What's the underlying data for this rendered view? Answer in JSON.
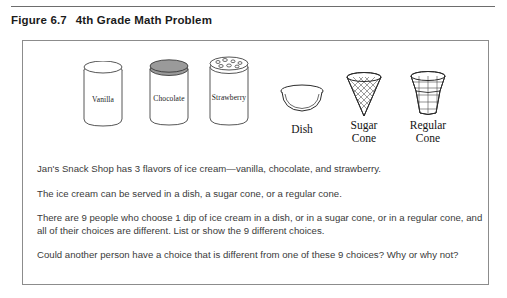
{
  "caption": {
    "figure_number": "Figure 6.7",
    "title": "4th Grade Math Problem"
  },
  "illustration": {
    "tubs": [
      {
        "label": "Vanilla",
        "lid": "plain",
        "icon": "ice-cream-tub-vanilla"
      },
      {
        "label": "Chocolate",
        "lid": "dark",
        "icon": "ice-cream-tub-chocolate"
      },
      {
        "label": "Strawberry",
        "lid": "speckled",
        "icon": "ice-cream-tub-strawberry"
      }
    ],
    "servings": [
      {
        "label": "Dish",
        "icon": "dish-icon"
      },
      {
        "label": "Sugar\nCone",
        "line1": "Sugar",
        "line2": "Cone",
        "icon": "sugar-cone-icon"
      },
      {
        "label": "Regular\nCone",
        "line1": "Regular",
        "line2": "Cone",
        "icon": "regular-cone-icon"
      }
    ]
  },
  "problem": {
    "paragraphs": [
      "Jan's Snack Shop has 3 flavors of ice cream—vanilla, chocolate, and strawberry.",
      "The ice cream can be served in a dish, a sugar cone, or a regular cone.",
      "There are 9 people who choose 1 dip of ice cream in a dish, or in a sugar cone, or in a regular cone, and all of their choices are different. List or show the 9 different choices.",
      "Could another person have a choice that is different from one of these 9 choices? Why or why not?"
    ]
  },
  "colors": {
    "rule": "#6d6d6d",
    "frame": "#8c8c8c",
    "text": "#3a3a3a",
    "caption": "#1b1b1b",
    "chocolate_lid": "#9a9a9a"
  }
}
